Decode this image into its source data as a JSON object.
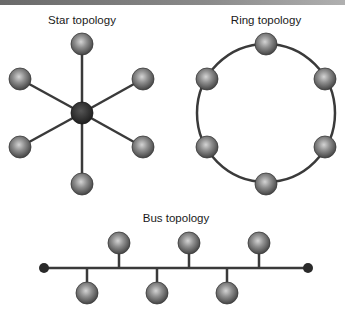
{
  "colors": {
    "top_bar": "#7a7a7a",
    "line": "#3a3a3a",
    "node_light": "#b8b8b8",
    "node_dark": "#4a4a4a",
    "hub": "#2a2a2a",
    "terminator": "#2a2a2a"
  },
  "diagrams": {
    "star": {
      "title": "Star topology",
      "hub": {
        "x": 82,
        "y": 113
      },
      "nodes": [
        {
          "x": 82,
          "y": 44
        },
        {
          "x": 143,
          "y": 79
        },
        {
          "x": 143,
          "y": 147
        },
        {
          "x": 82,
          "y": 184
        },
        {
          "x": 20,
          "y": 147
        },
        {
          "x": 20,
          "y": 79
        }
      ]
    },
    "ring": {
      "title": "Ring topology",
      "center": {
        "x": 266,
        "y": 113
      },
      "radius": 69,
      "nodes": [
        {
          "x": 266,
          "y": 44
        },
        {
          "x": 325,
          "y": 79
        },
        {
          "x": 325,
          "y": 147
        },
        {
          "x": 266,
          "y": 184
        },
        {
          "x": 207,
          "y": 147
        },
        {
          "x": 207,
          "y": 79
        }
      ]
    },
    "bus": {
      "title": "Bus topology",
      "line": {
        "x1": 44,
        "x2": 308,
        "y": 268
      },
      "upper_nodes": [
        {
          "x": 119,
          "y": 243
        },
        {
          "x": 189,
          "y": 243
        },
        {
          "x": 259,
          "y": 243
        }
      ],
      "lower_nodes": [
        {
          "x": 87,
          "y": 293
        },
        {
          "x": 157,
          "y": 293
        },
        {
          "x": 227,
          "y": 293
        }
      ]
    }
  }
}
